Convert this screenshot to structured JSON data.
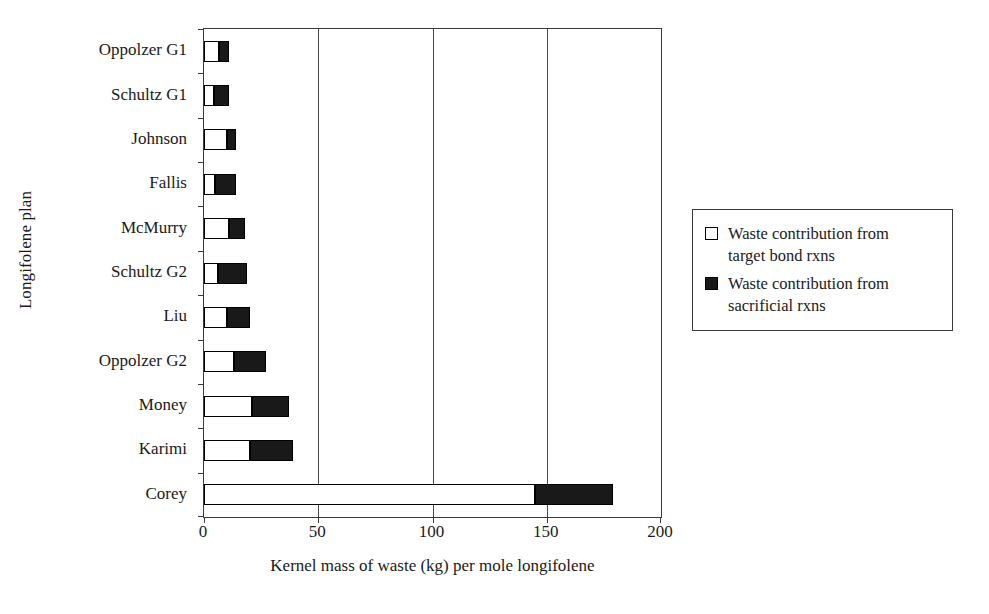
{
  "chart_data": {
    "type": "bar",
    "orientation": "horizontal",
    "stacked": true,
    "title": "",
    "xlabel": "Kernel mass of waste (kg) per mole longifolene",
    "ylabel": "Longifolene plan",
    "xlim": [
      0,
      200
    ],
    "xticks": [
      0,
      50,
      100,
      150,
      200
    ],
    "xtick_labels": [
      "0",
      "50",
      "100",
      "150",
      "200"
    ],
    "grid": "vertical",
    "legend_position": "right",
    "categories": [
      "Oppolzer G1",
      "Schultz G1",
      "Johnson",
      "Fallis",
      "McMurry",
      "Schultz G2",
      "Liu",
      "Oppolzer G2",
      "Money",
      "Karimi",
      "Corey"
    ],
    "series": [
      {
        "name": "Waste contribution from target bond rxns",
        "color": "#ffffff",
        "values": [
          6.5,
          4.5,
          10,
          5,
          11,
          6,
          10,
          13,
          21,
          20,
          145
        ]
      },
      {
        "name": "Waste contribution from sacrificial rxns",
        "color": "#191919",
        "values": [
          4.5,
          6.5,
          4,
          9,
          7,
          13,
          10,
          14,
          16,
          19,
          34
        ]
      }
    ],
    "totals": [
      11,
      11,
      14,
      14,
      18,
      19,
      20,
      27,
      37,
      39,
      179
    ]
  },
  "legend": {
    "entries": [
      {
        "swatch": "hollow",
        "label": "Waste contribution from\ntarget bond rxns"
      },
      {
        "swatch": "filled",
        "label": "Waste contribution from\nsacrificial rxns"
      }
    ]
  }
}
